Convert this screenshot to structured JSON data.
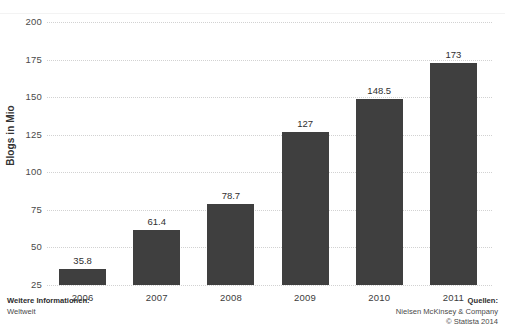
{
  "chart_data": {
    "type": "bar",
    "title": "",
    "xlabel": "",
    "ylabel": "Blogs in Mio",
    "categories": [
      "2006",
      "2007",
      "2008",
      "2009",
      "2010",
      "2011"
    ],
    "values": [
      35.8,
      61.4,
      78.7,
      127,
      148.5,
      173
    ],
    "value_labels": [
      "35.8",
      "61.4",
      "78.7",
      "127",
      "148.5",
      "173"
    ],
    "ylim": [
      25,
      200
    ],
    "yticks": [
      200,
      175,
      150,
      125,
      100,
      75,
      50,
      25
    ],
    "ytick_labels": [
      "200",
      "175",
      "150",
      "125",
      "100",
      "75",
      "50",
      "25"
    ],
    "grid": "horizontal-dotted",
    "legend": "none",
    "bar_color": "#3f3f3f",
    "gridline_color": "#d2d2d2",
    "background_color": "#ffffff"
  },
  "footer": {
    "left_heading": "Weitere Informationen:",
    "left_text": "Weltweit",
    "right_heading": "Quellen:",
    "right_source": "Nielsen McKinsey & Company",
    "right_copyright": "© Statista 2014"
  },
  "cropped_title": ""
}
